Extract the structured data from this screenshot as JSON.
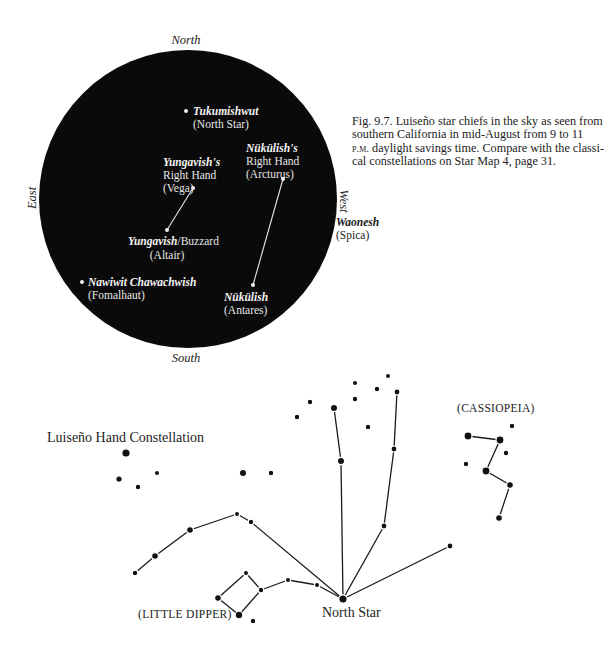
{
  "top_chart": {
    "directions": {
      "north": "North",
      "south": "South",
      "east": "East",
      "west": "West"
    },
    "sky_circle": {
      "cx": 188,
      "cy": 199,
      "r": 149,
      "fill": "#0a0a0a"
    },
    "stars": [
      {
        "id": "tukumishwut",
        "native": "Tukumishwut",
        "english": "(North Star)",
        "x": 186,
        "y": 111
      },
      {
        "id": "vega",
        "native": "Yungavish's",
        "line2": "Right Hand",
        "english": "(Vega)",
        "x": 193,
        "y": 188
      },
      {
        "id": "arcturus",
        "native": "Nükülish's",
        "line2": "Right Hand",
        "english": "(Arcturus)",
        "x": 283,
        "y": 179
      },
      {
        "id": "altair",
        "native": "Yungavish",
        "native_suffix": "/Buzzard",
        "english": "(Altair)",
        "x": 167,
        "y": 230
      },
      {
        "id": "fomalhaut",
        "native": "Nawiwit Chawachwish",
        "english": "(Fomalhaut)",
        "x": 82,
        "y": 282
      },
      {
        "id": "antares",
        "native": "Nükülish",
        "english": "(Antares)",
        "x": 253,
        "y": 285
      },
      {
        "id": "spica",
        "native": "Waonesh",
        "english": "(Spica)",
        "x": 334,
        "y": 215
      }
    ],
    "lines": [
      {
        "from": "vega",
        "to": "altair"
      },
      {
        "from": "arcturus",
        "to": "antares"
      }
    ]
  },
  "caption": {
    "fig_label": "Fig. 9.7.",
    "line1": "Fig. 9.7. Luiseño star chiefs in the sky as seen from",
    "line2": "southern California in mid-August from 9 to 11",
    "line3_sc": "p.m.",
    "line3": " daylight savings time. Compare with the classi-",
    "line4": "cal constellations on Star Map 4, page 31."
  },
  "bottom_chart": {
    "labels": {
      "hand_constellation": "Luiseño Hand Constellation",
      "cassiopeia": "(CASSIOPEIA)",
      "little_dipper": "(LITTLE DIPPER)",
      "north_star": "North Star"
    },
    "stars": [
      [
        126,
        453,
        4.2
      ],
      [
        119,
        479,
        3.2
      ],
      [
        138,
        487,
        2.8
      ],
      [
        157,
        473,
        2.6
      ],
      [
        243,
        473,
        3.6
      ],
      [
        271,
        473,
        2.8
      ],
      [
        297,
        417,
        2.8
      ],
      [
        310,
        402,
        2.8
      ],
      [
        334,
        408,
        3.6
      ],
      [
        355,
        383,
        2.6
      ],
      [
        355,
        399,
        2.8
      ],
      [
        377,
        389,
        2.8
      ],
      [
        388,
        376,
        2.6
      ],
      [
        397,
        392,
        3.0
      ],
      [
        368,
        427,
        2.8
      ],
      [
        341,
        461,
        3.6
      ],
      [
        394,
        449,
        3.0
      ],
      [
        384,
        526,
        3.0
      ],
      [
        450,
        546,
        3.0
      ],
      [
        343,
        599,
        4.2
      ],
      [
        135,
        573,
        2.8
      ],
      [
        155,
        556,
        3.4
      ],
      [
        190,
        530,
        3.4
      ],
      [
        237,
        514,
        2.6
      ],
      [
        251,
        522,
        2.8
      ],
      [
        246,
        573,
        2.6
      ],
      [
        218,
        598,
        3.4
      ],
      [
        261,
        590,
        2.8
      ],
      [
        288,
        580,
        2.6
      ],
      [
        317,
        585,
        2.6
      ],
      [
        239,
        615,
        3.8
      ],
      [
        253,
        621,
        2.8
      ],
      [
        468,
        436,
        4.0
      ],
      [
        500,
        440,
        4.0
      ],
      [
        512,
        426,
        2.8
      ],
      [
        506,
        453,
        2.8
      ],
      [
        466,
        464,
        2.8
      ],
      [
        486,
        471,
        4.0
      ],
      [
        510,
        485,
        3.4
      ],
      [
        499,
        518,
        3.4
      ]
    ],
    "lines": [
      [
        334,
        408,
        341,
        461
      ],
      [
        341,
        461,
        343,
        599
      ],
      [
        397,
        392,
        394,
        449
      ],
      [
        394,
        449,
        384,
        526
      ],
      [
        384,
        526,
        343,
        599
      ],
      [
        450,
        546,
        343,
        599
      ],
      [
        251,
        522,
        343,
        599
      ],
      [
        317,
        585,
        343,
        599
      ],
      [
        288,
        580,
        317,
        585
      ],
      [
        261,
        590,
        288,
        580
      ],
      [
        135,
        573,
        155,
        556
      ],
      [
        155,
        556,
        190,
        530
      ],
      [
        190,
        530,
        237,
        514
      ],
      [
        237,
        514,
        251,
        522
      ],
      [
        246,
        573,
        261,
        590
      ],
      [
        261,
        590,
        239,
        615
      ],
      [
        239,
        615,
        218,
        598
      ],
      [
        218,
        598,
        246,
        573
      ],
      [
        468,
        436,
        500,
        440
      ],
      [
        500,
        440,
        486,
        471
      ],
      [
        486,
        471,
        510,
        485
      ],
      [
        510,
        485,
        499,
        518
      ]
    ]
  }
}
